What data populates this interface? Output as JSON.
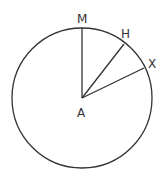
{
  "diagram": {
    "type": "circle-with-radii",
    "center": {
      "label": "A",
      "x": 82,
      "y": 98
    },
    "radius": 70,
    "points": [
      {
        "label": "M",
        "x": 82,
        "y": 28
      },
      {
        "label": "H",
        "x": 124,
        "y": 44
      },
      {
        "label": "X",
        "x": 144,
        "y": 67
      }
    ],
    "segments": [
      {
        "from": "A",
        "to": "M"
      },
      {
        "from": "A",
        "to": "H"
      },
      {
        "from": "A",
        "to": "X"
      }
    ],
    "labels": {
      "M": "M",
      "H": "H",
      "X": "X",
      "A": "A"
    },
    "stroke_color": "#333333"
  }
}
